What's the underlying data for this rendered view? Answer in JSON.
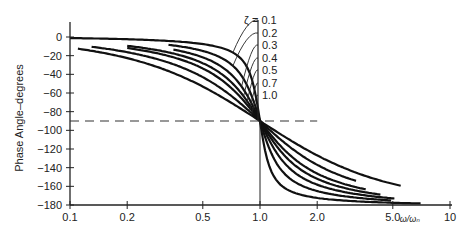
{
  "chart_data": {
    "type": "line",
    "title": "",
    "xlabel": "ω/ωₙ",
    "ylabel": "Phase Angle–degrees",
    "xscale": "log",
    "xlim": [
      0.1,
      10
    ],
    "ylim": [
      -180,
      0
    ],
    "x_ticks": [
      0.1,
      0.2,
      0.5,
      1.0,
      2.0,
      5.0,
      10
    ],
    "x_tick_labels": [
      "0.1",
      "0.2",
      "0.5",
      "1.0",
      "2.0",
      "5.0",
      "10"
    ],
    "y_ticks": [
      0,
      -20,
      -40,
      -60,
      -80,
      -100,
      -120,
      -140,
      -160,
      -180
    ],
    "y_tick_labels": [
      "0",
      "−20",
      "−40",
      "−60",
      "−80",
      "−100",
      "−120",
      "−140",
      "−160",
      "−180"
    ],
    "grid": false,
    "reference_line": {
      "y": -90,
      "style": "dashed",
      "x_range": [
        0.1,
        2.0
      ]
    },
    "vertical_line": {
      "x": 1.0,
      "y_range": [
        -90,
        -180
      ]
    },
    "legend_prefix": "ζ = ",
    "series": [
      {
        "name": "ζ = 0.1",
        "zeta": 0.1,
        "x_range": [
          0.1,
          7.0
        ]
      },
      {
        "name": "ζ = 0.2",
        "zeta": 0.2,
        "x_range": [
          0.33,
          4.9
        ]
      },
      {
        "name": "ζ = 0.3",
        "zeta": 0.3,
        "x_range": [
          0.35,
          5.1
        ]
      },
      {
        "name": "ζ = 0.4",
        "zeta": 0.4,
        "x_range": [
          0.2,
          4.3
        ]
      },
      {
        "name": "ζ = 0.5",
        "zeta": 0.5,
        "x_range": [
          0.2,
          3.6
        ]
      },
      {
        "name": "ζ = 0.7",
        "zeta": 0.7,
        "x_range": [
          0.13,
          3.2
        ]
      },
      {
        "name": "ζ = 1.0",
        "zeta": 1.0,
        "x_range": [
          0.11,
          5.5
        ]
      }
    ],
    "sample_points": {
      "x": [
        0.1,
        0.2,
        0.5,
        1.0,
        2.0,
        5.0
      ],
      "ζ=0.1": [
        -1.2,
        -2.4,
        -7.6,
        -90,
        -172.4,
        -177.6
      ],
      "ζ=0.2": [
        -2.3,
        -4.8,
        -14.9,
        -90,
        -165.1,
        -175.2
      ],
      "ζ=0.3": [
        -3.5,
        -7.1,
        -21.8,
        -90,
        -158.2,
        -172.9
      ],
      "ζ=0.4": [
        -4.6,
        -9.5,
        -28.1,
        -90,
        -151.9,
        -170.6
      ],
      "ζ=0.5": [
        -5.8,
        -11.8,
        -33.7,
        -90,
        -146.3,
        -168.2
      ],
      "ζ=0.7": [
        -8.1,
        -16.3,
        -43.0,
        -90,
        -137.0,
        -163.7
      ],
      "ζ=1.0": [
        -11.4,
        -22.6,
        -53.1,
        -90,
        -126.9,
        -157.4
      ]
    }
  }
}
